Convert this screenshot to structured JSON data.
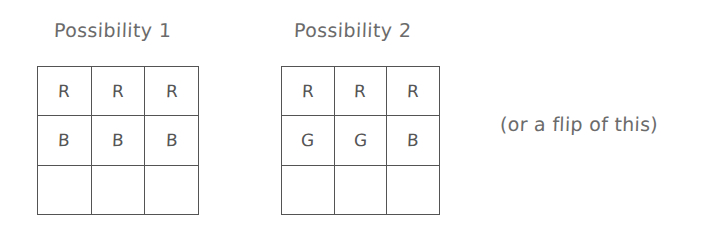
{
  "figure": {
    "background_color": "#ffffff",
    "ink_color": "#555555",
    "grid_line_color": "#545454",
    "text_color": "#6b6b6b"
  },
  "grids": [
    {
      "id": "possibility-1",
      "title": "Possibility 1",
      "rows": 3,
      "columns": 3,
      "cells": [
        [
          "R",
          "R",
          "R"
        ],
        [
          "B",
          "B",
          "B"
        ],
        [
          "",
          "",
          ""
        ]
      ]
    },
    {
      "id": "possibility-2",
      "title": "Possibility 2",
      "rows": 3,
      "columns": 3,
      "cells": [
        [
          "R",
          "R",
          "R"
        ],
        [
          "G",
          "G",
          "B"
        ],
        [
          "",
          "",
          ""
        ]
      ]
    }
  ],
  "annotation": {
    "text": "(or a flip of this)"
  }
}
